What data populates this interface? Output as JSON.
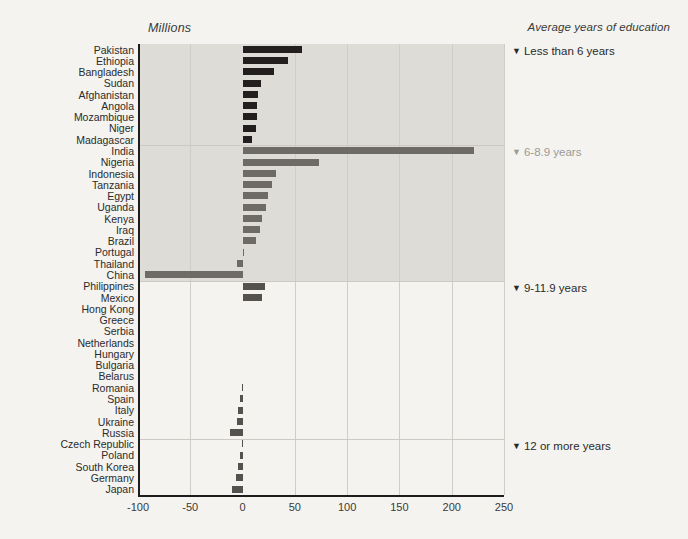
{
  "titles": {
    "left": "Millions",
    "right": "Average years of education"
  },
  "axis": {
    "xticks": [
      "-100",
      "-50",
      "0",
      "50",
      "100",
      "150",
      "200",
      "250"
    ],
    "xtick_values": [
      -100,
      -50,
      0,
      50,
      100,
      150,
      200,
      250
    ],
    "xmin": -100,
    "xmax": 250
  },
  "group_notes": [
    {
      "marker": "▼",
      "label": "Less than 6 years",
      "muted": false
    },
    {
      "marker": "▼",
      "label": "6-8.9 years",
      "muted": true
    },
    {
      "marker": "▼",
      "label": "9-11.9 years",
      "muted": false
    },
    {
      "marker": "▼",
      "label": "12 or more years",
      "muted": false
    }
  ],
  "colors": {
    "dark_bar": "#231f1e",
    "mid_bar": "#6e6b66",
    "gray_bar": "#55524e",
    "band_dark": "#dedcd6",
    "band_light": "#eceae5",
    "background": "#f4f3ef",
    "axis": "#1d1d1d"
  },
  "chart_data": {
    "type": "bar",
    "orientation": "horizontal",
    "title": "Millions",
    "xlabel": "Millions",
    "ylabel": "",
    "xlim": [
      -100,
      250
    ],
    "grid": true,
    "legend": "right-side group annotations",
    "categories": [
      "Pakistan",
      "Ethiopia",
      "Bangladesh",
      "Sudan",
      "Afghanistan",
      "Angola",
      "Mozambique",
      "Niger",
      "Madagascar",
      "India",
      "Nigeria",
      "Indonesia",
      "Tanzania",
      "Egypt",
      "Uganda",
      "Kenya",
      "Iraq",
      "Brazil",
      "Portugal",
      "Thailand",
      "China",
      "Philippines",
      "Mexico",
      "Hong Kong",
      "Greece",
      "Serbia",
      "Netherlands",
      "Hungary",
      "Bulgaria",
      "Belarus",
      "Romania",
      "Spain",
      "Italy",
      "Ukraine",
      "Russia",
      "Czech Republic",
      "Poland",
      "South Korea",
      "Germany",
      "Japan"
    ],
    "values": [
      57,
      43,
      30,
      18,
      15,
      14,
      14,
      13,
      9,
      221,
      73,
      32,
      28,
      24,
      22,
      19,
      17,
      13,
      1,
      -5,
      -93,
      21,
      19,
      0,
      0,
      0,
      0,
      0,
      0,
      0,
      -1,
      -2,
      -4,
      -5,
      -12,
      -1,
      -2,
      -4,
      -6,
      -10
    ],
    "groups": [
      {
        "name": "Less than 6 years",
        "from": "Pakistan",
        "to": "Madagascar"
      },
      {
        "name": "6-8.9 years",
        "from": "India",
        "to": "China"
      },
      {
        "name": "9-11.9 years",
        "from": "Philippines",
        "to": "Russia"
      },
      {
        "name": "12 or more years",
        "from": "Czech Republic",
        "to": "Japan"
      }
    ]
  }
}
